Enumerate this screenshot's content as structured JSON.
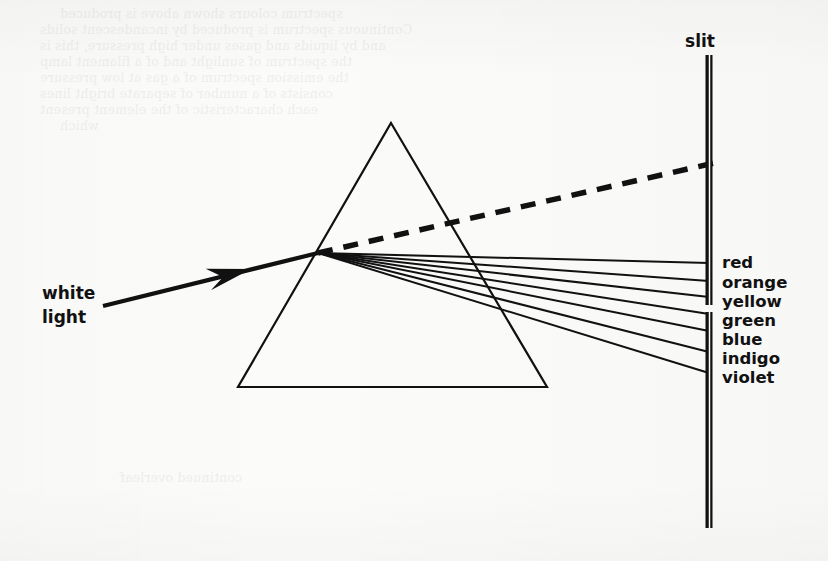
{
  "figure": {
    "kind": "optics-diagram",
    "background_color": "#fbfbfa",
    "ink_color": "#111111",
    "canvas": {
      "width": 828,
      "height": 561
    }
  },
  "labels": {
    "source": {
      "line1": "white",
      "line2": "light",
      "x": 42,
      "y1": 299,
      "y2": 323
    },
    "slit": {
      "text": "slit",
      "x": 700,
      "y": 47
    }
  },
  "spectrum": {
    "colors": [
      {
        "name": "red",
        "label": "red",
        "label_x": 722,
        "label_y": 268,
        "slit_y": 263
      },
      {
        "name": "orange",
        "label": "orange",
        "label_x": 722,
        "label_y": 288,
        "slit_y": 281
      },
      {
        "name": "yellow",
        "label": "yellow",
        "label_x": 722,
        "label_y": 307,
        "slit_y": 297
      },
      {
        "name": "green",
        "label": "green",
        "label_x": 722,
        "label_y": 326,
        "slit_y": 314
      },
      {
        "name": "blue",
        "label": "blue",
        "label_x": 722,
        "label_y": 345,
        "slit_y": 331
      },
      {
        "name": "indigo",
        "label": "indigo",
        "label_x": 722,
        "label_y": 364,
        "slit_y": 352
      },
      {
        "name": "violet",
        "label": "violet",
        "label_x": 722,
        "label_y": 383,
        "slit_y": 373
      }
    ]
  },
  "prism": {
    "apex": {
      "x": 391,
      "y": 123
    },
    "bottom_left": {
      "x": 238,
      "y": 387
    },
    "bottom_right": {
      "x": 547,
      "y": 387
    },
    "stroke_width": 2.2
  },
  "incident_ray": {
    "start": {
      "x": 103,
      "y": 306
    },
    "end": {
      "x": 318,
      "y": 253
    },
    "arrow_tip": {
      "x": 251,
      "y": 269
    },
    "stroke_width": 4.2
  },
  "refraction_point": {
    "x": 318,
    "y": 253
  },
  "undeviated_dashed_ray": {
    "start": {
      "x": 318,
      "y": 253
    },
    "end": {
      "x": 714,
      "y": 163
    },
    "dash": "15 11",
    "stroke_width": 5.5
  },
  "slit_screen": {
    "x": 709,
    "upper_bar": {
      "y_top": 55,
      "y_bottom": 305
    },
    "lower_bar": {
      "y_top": 312,
      "y_bottom": 528
    },
    "bar_width": 7,
    "inner_line_color": "#ffffff"
  },
  "ghost_show_through": [
    {
      "x": 60,
      "y": 6,
      "text": "spectrum colours shown above is produced"
    },
    {
      "x": 40,
      "y": 22,
      "text": "Continuous spectrum is produced by incandescent solids"
    },
    {
      "x": 40,
      "y": 38,
      "text": "and by liquids and gases under high pressure, this is"
    },
    {
      "x": 40,
      "y": 54,
      "text": "the spectrum of sunlight and of a filament lamp"
    },
    {
      "x": 40,
      "y": 70,
      "text": "the emission spectrum of a gas at low pressure"
    },
    {
      "x": 40,
      "y": 86,
      "text": "consists of a number of separate bright lines"
    },
    {
      "x": 40,
      "y": 102,
      "text": "each characteristic of the element present"
    },
    {
      "x": 60,
      "y": 118,
      "text": "which"
    },
    {
      "x": 120,
      "y": 470,
      "text": "continued overleaf"
    }
  ]
}
